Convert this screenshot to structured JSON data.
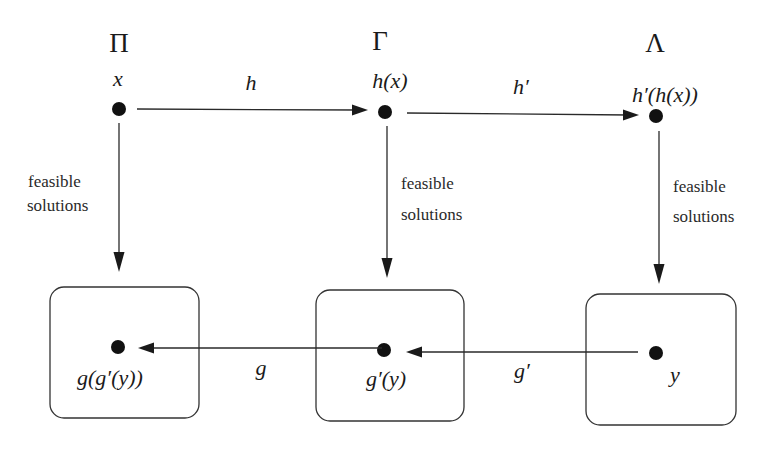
{
  "diagram": {
    "problems": [
      {
        "symbol": "Π",
        "instance_label": "x"
      },
      {
        "symbol": "Γ",
        "instance_label": "h(x)"
      },
      {
        "symbol": "Λ",
        "instance_label": "h′(h(x))"
      }
    ],
    "instance_maps": [
      {
        "label": "h",
        "from": "Π",
        "to": "Γ"
      },
      {
        "label": "h′",
        "from": "Γ",
        "to": "Λ"
      }
    ],
    "vertical_edges": [
      {
        "label_line1": "feasible",
        "label_line2": "solutions"
      },
      {
        "label_line1": "feasible",
        "label_line2": "solutions"
      },
      {
        "label_line1": "feasible",
        "label_line2": "solutions"
      }
    ],
    "solution_boxes": [
      {
        "point_label": "g(g′(y))"
      },
      {
        "point_label": "g′(y)"
      },
      {
        "point_label": "y"
      }
    ],
    "solution_maps": [
      {
        "label": "g",
        "from": "Γ-solutions",
        "to": "Π-solutions"
      },
      {
        "label": "g′",
        "from": "Λ-solutions",
        "to": "Γ-solutions"
      }
    ]
  }
}
